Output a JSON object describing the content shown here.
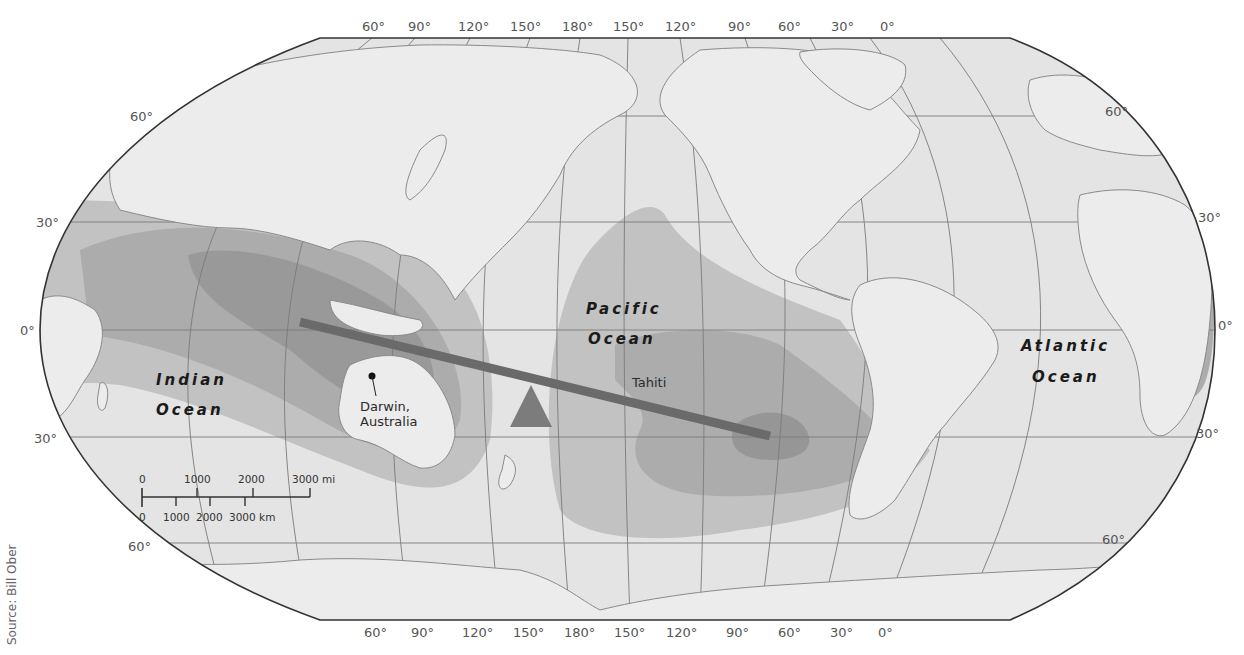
{
  "map": {
    "projection": "Robinson-like world map, Pacific-centered",
    "colors": {
      "background": "#ffffff",
      "ocean": "#e3e3e3",
      "land": "#ececec",
      "coastline": "#8a8a8a",
      "shade_light": "#c4c4c4",
      "shade_medium": "#acacac",
      "shade_dark": "#959595",
      "pressure_line": "#6a6a6a",
      "triangle": "#7c7c7c",
      "outline": "#333333"
    },
    "longitude_labels_top": [
      "60°",
      "90°",
      "120°",
      "150°",
      "180°",
      "150°",
      "120°",
      "90°",
      "60°",
      "30°",
      "0°"
    ],
    "longitude_labels_bottom": [
      "60°",
      "90°",
      "120°",
      "150°",
      "180°",
      "150°",
      "120°",
      "90°",
      "60°",
      "30°",
      "0°"
    ],
    "latitude_labels_left": [
      "60°",
      "30°",
      "0°",
      "30°",
      "60°"
    ],
    "latitude_labels_right": [
      "60°",
      "30°",
      "0°",
      "30°",
      "60°"
    ],
    "ocean_labels": {
      "indian": [
        "Indian",
        "Ocean"
      ],
      "pacific": [
        "Pacific",
        "Ocean"
      ],
      "atlantic": [
        "Atlantic",
        "Ocean"
      ]
    },
    "places": {
      "darwin": [
        "Darwin,",
        "Australia"
      ],
      "tahiti": "Tahiti"
    },
    "scale_bar": {
      "miles": [
        "0",
        "1000",
        "2000",
        "3000 mi"
      ],
      "km": [
        "0",
        "1000",
        "2000",
        "3000 km"
      ]
    },
    "source": "Source: Bill Ober"
  }
}
